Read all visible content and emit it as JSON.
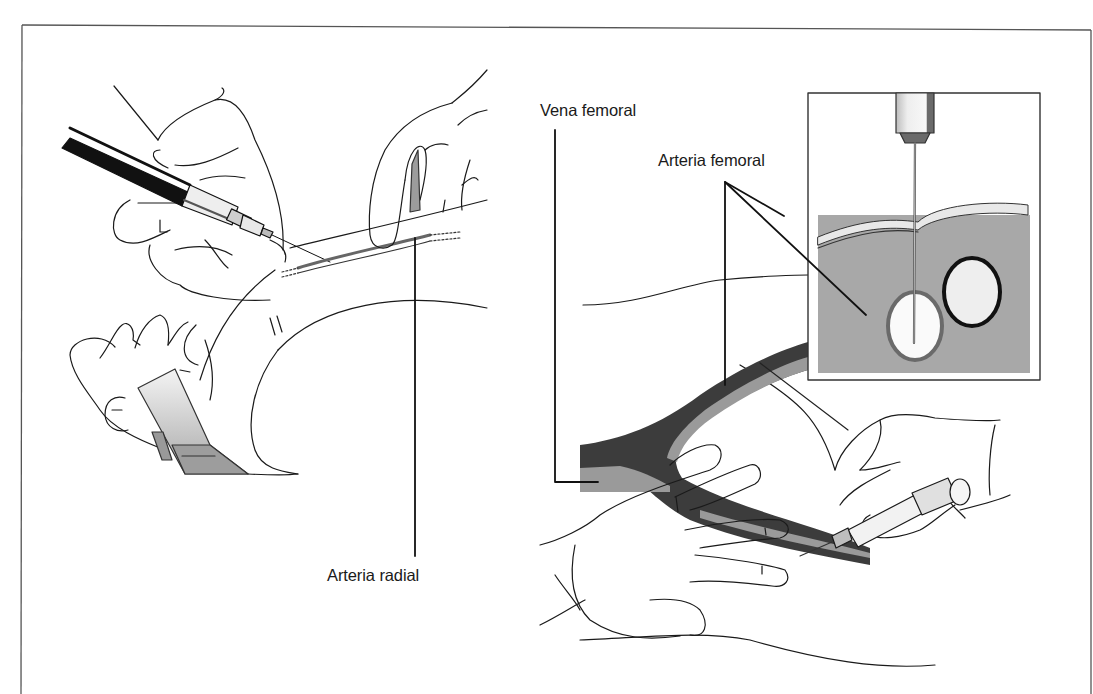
{
  "figure": {
    "panels": [
      {
        "id": "left",
        "description": "Radial artery puncture at the wrist",
        "labels": [
          {
            "text": "Arteria radial"
          }
        ]
      },
      {
        "id": "right",
        "description": "Femoral artery puncture at the groin with cross-section inset",
        "labels": [
          {
            "text": "Vena femoral"
          },
          {
            "text": "Arteria femoral"
          }
        ]
      }
    ],
    "colors": {
      "line": "#1a1a1a",
      "vein_dark": "#3a3a3a",
      "artery_gray": "#9a9a9a",
      "tissue_gray": "#a8a8a8",
      "skin_layer": "#e6e6e6",
      "frame": "#555555"
    }
  }
}
